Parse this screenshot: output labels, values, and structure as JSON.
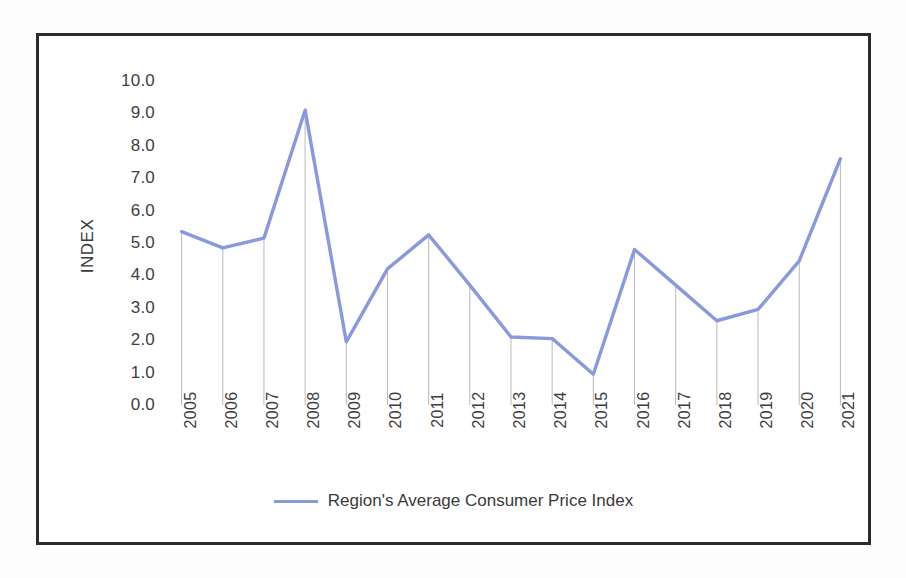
{
  "chart_data": {
    "type": "line",
    "title": "",
    "xlabel": "",
    "ylabel": "INDEX",
    "categories": [
      "2005",
      "2006",
      "2007",
      "2008",
      "2009",
      "2010",
      "2011",
      "2012",
      "2013",
      "2014",
      "2015",
      "2016",
      "2017",
      "2018",
      "2019",
      "2020",
      "2021"
    ],
    "series": [
      {
        "name": "Region's Average Consumer Price Index",
        "color": "#8a98dd",
        "values": [
          5.35,
          4.85,
          5.15,
          9.1,
          1.95,
          4.2,
          5.25,
          3.7,
          2.1,
          2.05,
          0.95,
          4.8,
          3.7,
          2.6,
          2.95,
          4.45,
          7.6
        ]
      }
    ],
    "ylim": [
      0,
      10
    ],
    "ytick_labels": [
      "10.0",
      "9.0",
      "8.0",
      "7.0",
      "6.0",
      "5.0",
      "4.0",
      "3.0",
      "2.0",
      "1.0",
      "0.0"
    ],
    "ytick_values": [
      10,
      9,
      8,
      7,
      6,
      5,
      4,
      3,
      2,
      1,
      0
    ],
    "grid": false,
    "droplines": true,
    "legend_position": "bottom",
    "legend": [
      "Region's Average Consumer Price Index"
    ]
  },
  "legend": {
    "label": "Region's Average Consumer Price Index",
    "swatch_color": "#8a98dd"
  },
  "axes": {
    "y_title": "INDEX"
  },
  "style": {
    "line_color": "#8a98dd",
    "dropline_color": "#b9b9b9",
    "border_color": "#2b2b2b",
    "text_color": "#3d3d3d",
    "background": "#ffffff"
  }
}
